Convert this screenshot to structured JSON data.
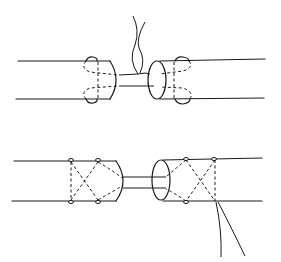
{
  "diagram": {
    "figures": [
      {
        "name": "top",
        "technique": "loop stitches with threads exiting upward between ends"
      },
      {
        "name": "bottom",
        "technique": "crossed (X) stitches with threads exiting downward from right segment"
      }
    ],
    "colors": {
      "ink": "#1a1a1a",
      "background": "#ffffff"
    }
  }
}
